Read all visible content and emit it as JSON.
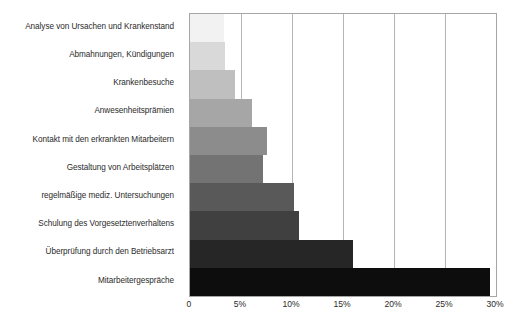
{
  "chart_data": {
    "type": "bar",
    "orientation": "horizontal",
    "title": "",
    "subtitle": "",
    "xlabel": "",
    "ylabel": "",
    "xlim": [
      0,
      30
    ],
    "grid": true,
    "legend": "none",
    "tick_labels": [
      "0",
      "5%",
      "10%",
      "15%",
      "20%",
      "25%",
      "30%"
    ],
    "tick_values": [
      0,
      5,
      10,
      15,
      20,
      25,
      30
    ],
    "categories": [
      "Analyse von Ursachen und Krankenstand",
      "Abmahnungen, Kündigungen",
      "Krankenbesuche",
      "Anwesenheitsprämien",
      "Kontakt mit den erkrankten Mitarbeitern",
      "Gestaltung von Arbeitsplätzen",
      "regelmäßige mediz. Untersuchungen",
      "Schulung des Vorgesetztenverhaltens",
      "Überprüfung durch den Betriebsarzt",
      "Mitarbeitergespräche"
    ],
    "values": [
      3.3,
      3.4,
      4.4,
      6.1,
      7.5,
      7.2,
      10.2,
      10.7,
      16.0,
      29.4
    ],
    "bar_colors": [
      "#f2f2f2",
      "#d9d9d9",
      "#bfbfbf",
      "#a6a6a6",
      "#8c8c8c",
      "#737373",
      "#595959",
      "#404040",
      "#262626",
      "#0d0d0d"
    ],
    "axis_color": "#a6a6a6",
    "grid_color": "#b5b5b5",
    "text_color": "#2b2b2b"
  }
}
